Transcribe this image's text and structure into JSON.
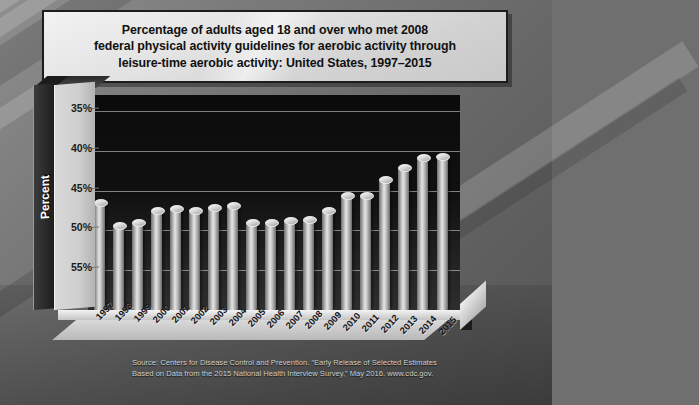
{
  "title": {
    "line1": "Percentage of adults aged 18 and over who met 2008",
    "line2": "federal physical activity guidelines for aerobic activity through",
    "line3": "leisure-time aerobic activity: United States, 1997–2015"
  },
  "axis": {
    "y_label": "Percent",
    "y_ticks": [
      "55%",
      "50%",
      "45%",
      "40%",
      "35%"
    ]
  },
  "source": {
    "line1": "Source: Centers for Disease Control and Prevention. “Early Release of Selected Estimates",
    "line2": "Based on Data from the 2015 National Health Interview Survey,” May 2016. www.cdc.gov."
  },
  "colors": {
    "plot_background": "#101010",
    "bar_light": "#e6e6e6",
    "bar_dark": "#6a6a6a",
    "title_plate": "#e2e2e2",
    "page_background": "#6f6f6f"
  },
  "chart_data": {
    "type": "bar",
    "title": "Percentage of adults aged 18 and over who met 2008 federal physical activity guidelines for aerobic activity through leisure-time aerobic activity: United States, 1997–2015",
    "xlabel": "",
    "ylabel": "Percent",
    "ylim": [
      30,
      57
    ],
    "yticks": [
      35,
      40,
      45,
      50,
      55
    ],
    "grid": true,
    "legend": false,
    "categories": [
      "1997",
      "1998",
      "1999",
      "2000",
      "2001",
      "2002",
      "2003",
      "2004",
      "2005",
      "2006",
      "2007",
      "2008",
      "2009",
      "2010",
      "2011",
      "2012",
      "2013",
      "2014",
      "2015"
    ],
    "values": [
      43.6,
      40.7,
      41.1,
      42.6,
      42.8,
      42.6,
      42.9,
      43.2,
      41.0,
      41.0,
      41.3,
      41.4,
      42.5,
      44.5,
      44.5,
      46.5,
      47.9,
      49.2,
      49.3
    ]
  }
}
